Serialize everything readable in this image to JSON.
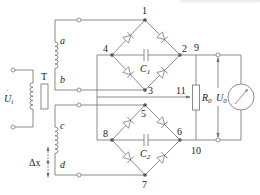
{
  "diagram": {
    "type": "circuit-schematic",
    "colors": {
      "wire": "#6e6e6e",
      "node": "#555555",
      "text": "#222222",
      "background": "#ffffff"
    },
    "transformer": {
      "label": "T",
      "input_voltage": "U",
      "input_subscript": "i"
    },
    "secondary_coils": [
      {
        "top": "a",
        "bottom": "b"
      },
      {
        "top": "c",
        "bottom": "d"
      }
    ],
    "displacement": {
      "label": "Δx"
    },
    "nodes": [
      "1",
      "2",
      "3",
      "4",
      "5",
      "6",
      "7",
      "8",
      "9",
      "10",
      "11"
    ],
    "capacitors": [
      {
        "label": "C",
        "sub": "1"
      },
      {
        "label": "C",
        "sub": "2"
      }
    ],
    "resistor": {
      "label": "R",
      "sub": "0"
    },
    "output": {
      "label": "U",
      "sub": "0"
    },
    "meter": {
      "icon": "meter-gauge-icon"
    }
  }
}
